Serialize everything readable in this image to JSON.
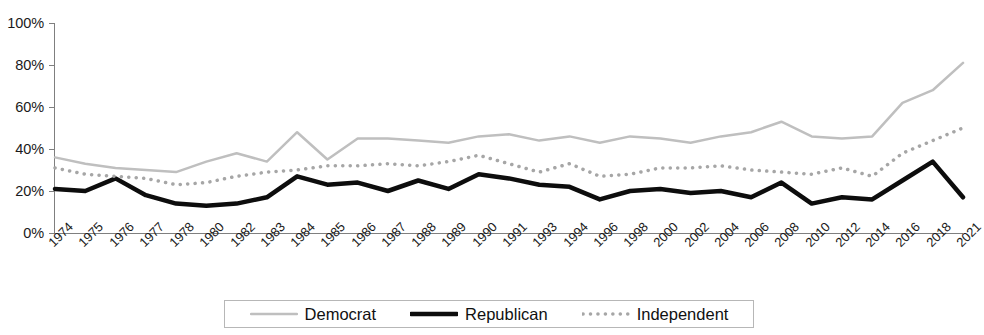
{
  "chart_data": {
    "type": "line",
    "title": "",
    "subtitle": "",
    "xlabel": "",
    "ylabel": "",
    "ylim": [
      0,
      100
    ],
    "ytick_labels": [
      "100%",
      "80%",
      "60%",
      "40%",
      "20%",
      "0%"
    ],
    "ytick_values": [
      100,
      80,
      60,
      40,
      20,
      0
    ],
    "grid": false,
    "legend_position": "bottom",
    "categories": [
      "1974",
      "1975",
      "1976",
      "1977",
      "1978",
      "1980",
      "1982",
      "1983",
      "1984",
      "1985",
      "1986",
      "1987",
      "1988",
      "1989",
      "1990",
      "1991",
      "1993",
      "1994",
      "1996",
      "1998",
      "2000",
      "2002",
      "2004",
      "2006",
      "2008",
      "2010",
      "2012",
      "2014",
      "2016",
      "2018",
      "2021"
    ],
    "series": [
      {
        "name": "Democrat",
        "color": "#bfbfbf",
        "style": "solid",
        "width": 2.5,
        "values": [
          36,
          33,
          31,
          30,
          29,
          34,
          38,
          34,
          48,
          35,
          45,
          45,
          44,
          43,
          46,
          47,
          44,
          46,
          43,
          46,
          45,
          43,
          46,
          48,
          53,
          46,
          45,
          46,
          62,
          68,
          81
        ]
      },
      {
        "name": "Republican",
        "color": "#0d0d0d",
        "style": "solid",
        "width": 4.5,
        "values": [
          21,
          20,
          26,
          18,
          14,
          13,
          14,
          17,
          27,
          23,
          24,
          20,
          25,
          21,
          28,
          26,
          23,
          22,
          16,
          20,
          21,
          19,
          20,
          17,
          24,
          14,
          17,
          16,
          25,
          34,
          17
        ]
      },
      {
        "name": "Independent",
        "color": "#a6a6a6",
        "style": "dotted",
        "width": 3.5,
        "values": [
          31,
          28,
          27,
          26,
          23,
          24,
          27,
          29,
          30,
          32,
          32,
          33,
          32,
          34,
          37,
          33,
          29,
          33,
          27,
          28,
          31,
          31,
          32,
          30,
          29,
          28,
          31,
          27,
          38,
          44,
          50
        ]
      }
    ]
  },
  "legend": {
    "items": [
      {
        "label": "Democrat",
        "swatch": "solid-light-line-swatch"
      },
      {
        "label": "Republican",
        "swatch": "solid-black-line-swatch"
      },
      {
        "label": "Independent",
        "swatch": "dotted-gray-line-swatch"
      }
    ]
  },
  "axis": {
    "y_labels": [
      "100%",
      "80%",
      "60%",
      "40%",
      "20%",
      "0%"
    ],
    "x_labels": [
      "1974",
      "1975",
      "1976",
      "1977",
      "1978",
      "1980",
      "1982",
      "1983",
      "1984",
      "1985",
      "1986",
      "1987",
      "1988",
      "1989",
      "1990",
      "1991",
      "1993",
      "1994",
      "1996",
      "1998",
      "2000",
      "2002",
      "2004",
      "2006",
      "2008",
      "2010",
      "2012",
      "2014",
      "2016",
      "2018",
      "2021"
    ]
  }
}
